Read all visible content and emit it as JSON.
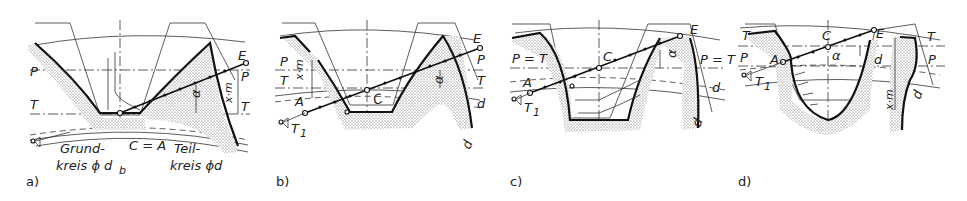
{
  "figure": {
    "panels": [
      {
        "id": "a",
        "label": "a)",
        "labels": {
          "pitch_line": "P",
          "tool_line": "T",
          "end_point": "E",
          "pitch_right": "P",
          "tool_right": "T",
          "shift": "x·m",
          "angle": "α",
          "contact_point": "C = A",
          "base_circle_1": "Grund-",
          "base_circle_2": "kreis ϕ d",
          "base_circle_sub": "b",
          "pitch_circle_1": "Teil-",
          "pitch_circle_2": "kreis ϕd"
        }
      },
      {
        "id": "b",
        "label": "b)",
        "labels": {
          "pitch_line": "P",
          "tool_line": "T",
          "shift": "x·m",
          "start_point": "A",
          "contact_point": "C",
          "tangent_point": "T",
          "tangent_sub": "1",
          "end_point": "E",
          "pitch_right": "P",
          "tool_right": "T",
          "angle": "α",
          "pitch_diameter": "d",
          "base_diameter": "d",
          "base_sub": "b"
        }
      },
      {
        "id": "c",
        "label": "c)",
        "labels": {
          "pitch_tool_left": "P = T",
          "start_point": "A",
          "tangent_point": "T",
          "tangent_sub": "1",
          "contact_point": "C",
          "end_point": "E",
          "pitch_tool_right": "P = T",
          "angle": "α",
          "pitch_diameter": "d",
          "base_diameter": "d",
          "base_sub": "b"
        }
      },
      {
        "id": "d",
        "label": "d)",
        "labels": {
          "tool_line": "T",
          "pitch_line": "P",
          "start_point": "A",
          "tangent_point": "T",
          "tangent_sub": "1",
          "contact_point": "C",
          "angle": "α",
          "end_point": "E",
          "tool_right": "T",
          "pitch_right": "P",
          "pitch_diameter": "d",
          "base_diameter": "d",
          "base_sub": "b",
          "shift": "x·m"
        }
      }
    ]
  }
}
